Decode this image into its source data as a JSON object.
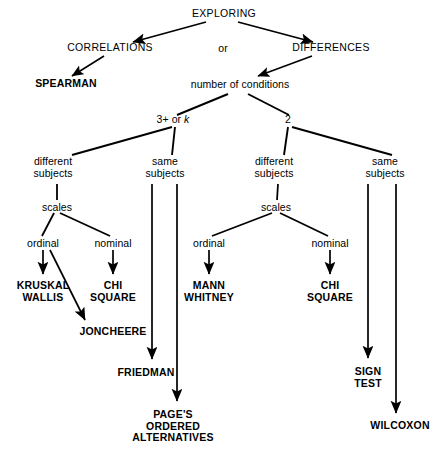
{
  "diagram": {
    "title": "EXPLORING",
    "type": "decision-tree",
    "nodes": {
      "root": "EXPLORING",
      "correlations": "CORRELATIONS",
      "or": "or",
      "differences": "DIFFERENCES",
      "spearman": "SPEARMAN",
      "number_of_conditions": "number of conditions",
      "three_plus_or_k_prefix": "3+ or ",
      "three_plus_or_k_italic": "k",
      "two": "2",
      "different_subjects_left": "different\nsubjects",
      "same_subjects_left": "same\nsubjects",
      "different_subjects_right": "different\nsubjects",
      "same_subjects_right": "same\nsubjects",
      "scales_left": "scales",
      "scales_right": "scales",
      "ordinal_left": "ordinal",
      "nominal_left": "nominal",
      "ordinal_right": "ordinal",
      "nominal_right": "nominal",
      "kruskal_wallis": "KRUSKAL\nWALLIS",
      "chi_square_left": "CHI\nSQUARE",
      "joncheere": "JONCHEERE",
      "friedman": "FRIEDMAN",
      "pages_ordered_alternatives": "PAGE'S\nORDERED\nALTERNATIVES",
      "mann_whitney": "MANN\nWHITNEY",
      "chi_square_right": "CHI\nSQUARE",
      "sign_test": "SIGN\nTEST",
      "wilcoxon": "WILCOXON"
    },
    "colors": {
      "line": "#000000",
      "text": "#000000",
      "background": "#ffffff"
    }
  }
}
